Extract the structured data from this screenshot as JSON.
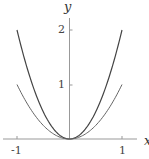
{
  "chart_data": {
    "type": "line",
    "title": "",
    "xlabel": "x",
    "ylabel": "y",
    "xlim": [
      -1.1,
      1.3
    ],
    "ylim": [
      0,
      2.2
    ],
    "grid": false,
    "legend": null,
    "xticks": [
      "-1",
      "1"
    ],
    "yticks": [
      "1",
      "2"
    ],
    "series": [
      {
        "name": "y = 2x^2",
        "x": [
          -1,
          -0.5,
          0,
          0.5,
          1
        ],
        "values": [
          2,
          0.5,
          0,
          0.5,
          2
        ],
        "color": "#444444"
      },
      {
        "name": "y = x^2",
        "x": [
          -1,
          -0.5,
          0,
          0.5,
          1
        ],
        "values": [
          1,
          0.25,
          0,
          0.25,
          1
        ],
        "color": "#666666"
      }
    ]
  },
  "labels": {
    "x_axis": "x",
    "y_axis": "y",
    "xtick_neg1": "-1",
    "xtick_1": "1",
    "ytick_1": "1",
    "ytick_2": "2"
  }
}
